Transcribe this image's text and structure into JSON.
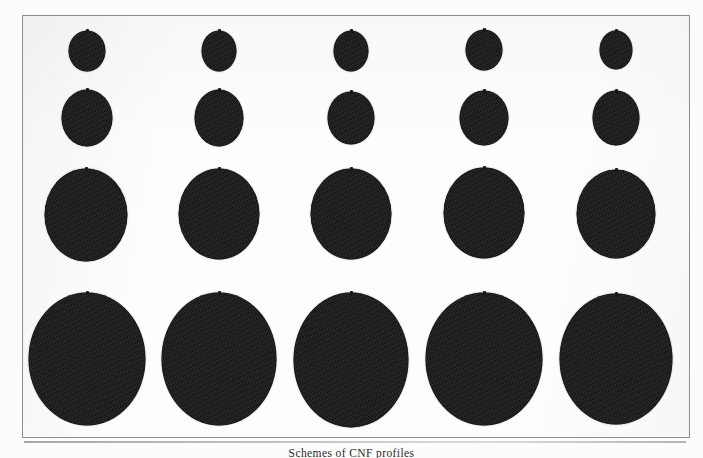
{
  "figure": {
    "caption": "Schemes of CNF profiles",
    "frame": {
      "border_color": "#8e8e8e",
      "background_color": "#fdfdfb"
    },
    "page_background": "#ffffff",
    "blob_color": "#171717",
    "columns": 5,
    "rows": 4
  },
  "chart_data": {
    "type": "scatter",
    "title": "Schemes of CNF profiles",
    "xlabel": "",
    "ylabel": "",
    "grid": false,
    "legend": null,
    "x": [
      74,
      176,
      281,
      383,
      485
    ],
    "categories": [
      "col-1",
      "col-2",
      "col-3",
      "col-4",
      "col-5"
    ],
    "series": [
      {
        "name": "row-1",
        "center_y": 50,
        "diameter_x": 36,
        "diameter_y": 40,
        "values": [
          36,
          34,
          34,
          36,
          33
        ],
        "points": [
          {
            "cx": 86,
            "cy": 50,
            "rx": 18,
            "ry": 20
          },
          {
            "cx": 218,
            "cy": 50,
            "rx": 17,
            "ry": 20
          },
          {
            "cx": 350,
            "cy": 50,
            "rx": 17,
            "ry": 20
          },
          {
            "cx": 483,
            "cy": 49,
            "rx": 18,
            "ry": 20
          },
          {
            "cx": 615,
            "cy": 49,
            "rx": 16,
            "ry": 19
          }
        ]
      },
      {
        "name": "row-2",
        "center_y": 117,
        "diameter_x": 50,
        "diameter_y": 56,
        "values": [
          50,
          48,
          46,
          48,
          46
        ],
        "points": [
          {
            "cx": 86,
            "cy": 117,
            "rx": 25,
            "ry": 28
          },
          {
            "cx": 218,
            "cy": 117,
            "rx": 24,
            "ry": 28
          },
          {
            "cx": 350,
            "cy": 117,
            "rx": 23,
            "ry": 26
          },
          {
            "cx": 483,
            "cy": 117,
            "rx": 24,
            "ry": 27
          },
          {
            "cx": 615,
            "cy": 117,
            "rx": 23,
            "ry": 27
          }
        ]
      },
      {
        "name": "row-3",
        "center_y": 214,
        "diameter_x": 82,
        "diameter_y": 92,
        "values": [
          82,
          80,
          80,
          80,
          78
        ],
        "points": [
          {
            "cx": 85,
            "cy": 214,
            "rx": 41,
            "ry": 46
          },
          {
            "cx": 218,
            "cy": 213,
            "rx": 40,
            "ry": 45
          },
          {
            "cx": 350,
            "cy": 213,
            "rx": 40,
            "ry": 45
          },
          {
            "cx": 483,
            "cy": 212,
            "rx": 40,
            "ry": 45
          },
          {
            "cx": 615,
            "cy": 213,
            "rx": 39,
            "ry": 44
          }
        ]
      },
      {
        "name": "row-4",
        "center_y": 358,
        "diameter_x": 117,
        "diameter_y": 133,
        "values": [
          117,
          115,
          115,
          117,
          113
        ],
        "points": [
          {
            "cx": 86,
            "cy": 358,
            "rx": 58,
            "ry": 66
          },
          {
            "cx": 218,
            "cy": 358,
            "rx": 57,
            "ry": 66
          },
          {
            "cx": 350,
            "cy": 359,
            "rx": 57,
            "ry": 67
          },
          {
            "cx": 483,
            "cy": 358,
            "rx": 58,
            "ry": 66
          },
          {
            "cx": 615,
            "cy": 358,
            "rx": 56,
            "ry": 65
          }
        ]
      }
    ]
  }
}
